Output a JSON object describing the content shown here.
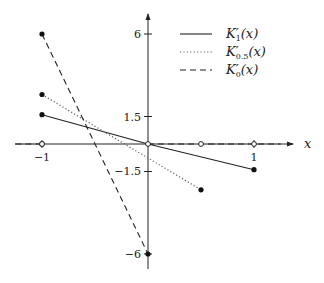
{
  "chart_data": {
    "type": "line",
    "title": "",
    "xlabel": "x",
    "ylabel": "",
    "xlim": [
      -1.25,
      1.4
    ],
    "ylim": [
      -6.8,
      7.1
    ],
    "x_ticks": [
      {
        "value": -1,
        "label": "−1"
      },
      {
        "value": 1,
        "label": "1"
      }
    ],
    "y_ticks": [
      {
        "value": 6,
        "label": "6"
      },
      {
        "value": 1.5,
        "label": "1.5"
      },
      {
        "value": -1.5,
        "label": "−1.5"
      },
      {
        "value": -6,
        "label": "−6"
      }
    ],
    "grid": false,
    "legend_position": "upper right",
    "series": [
      {
        "name": "K'_1(x)",
        "label_main": "K",
        "label_sub": "1",
        "label_tail": "(x)",
        "style": "solid",
        "x": [
          -1,
          0,
          1
        ],
        "y": [
          1.6,
          0,
          -1.4
        ],
        "filled_points": [
          [
            -1,
            1.6
          ],
          [
            1,
            -1.4
          ]
        ],
        "open_points": [
          [
            0,
            0
          ]
        ]
      },
      {
        "name": "K'_0.5(x)",
        "label_main": "K",
        "label_sub": "0.5",
        "label_tail": "(x)",
        "style": "dotted",
        "x": [
          -1,
          0.5
        ],
        "y": [
          2.7,
          -2.5
        ],
        "extra_segments": [
          [
            [
              -1.25,
              0
            ],
            [
              -1,
              0
            ]
          ],
          [
            [
              0.5,
              0
            ],
            [
              1.25,
              0
            ]
          ]
        ],
        "filled_points": [
          [
            -1,
            2.7
          ],
          [
            0.5,
            -2.5
          ]
        ],
        "open_points": [
          [
            -1,
            0
          ],
          [
            0.5,
            0
          ]
        ]
      },
      {
        "name": "K'_0(x)",
        "label_main": "K",
        "label_sub": "0",
        "label_tail": "(x)",
        "style": "dashed",
        "x": [
          -1,
          0
        ],
        "y": [
          6,
          -6
        ],
        "extra_segments": [
          [
            [
              -1.25,
              0
            ],
            [
              -1,
              0
            ]
          ],
          [
            [
              0,
              0
            ],
            [
              1.25,
              0
            ]
          ]
        ],
        "filled_points": [
          [
            -1,
            6
          ],
          [
            0,
            -6
          ]
        ],
        "open_points": [
          [
            -1,
            0
          ],
          [
            1,
            0
          ]
        ]
      }
    ]
  }
}
